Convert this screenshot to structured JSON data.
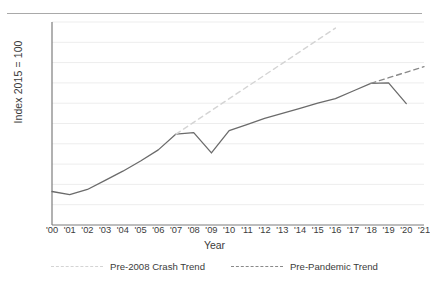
{
  "chart_data": {
    "type": "line",
    "title": "",
    "xlabel": "Year",
    "ylabel": "Index 2015 = 100",
    "xlim": [
      2000,
      2021
    ],
    "ylim": [
      40,
      140
    ],
    "ytick_step": 10,
    "yticks": [
      40,
      50,
      60,
      70,
      80,
      90,
      100,
      110,
      120,
      130,
      140
    ],
    "xticks": [
      "'00",
      "'01",
      "'02",
      "'03",
      "'04",
      "'05",
      "'06",
      "'07",
      "'08",
      "'09",
      "'10",
      "'11",
      "'12",
      "'13",
      "'14",
      "'15",
      "'16",
      "'17",
      "'18",
      "'19",
      "'20",
      "'21"
    ],
    "x": [
      2000,
      2001,
      2002,
      2003,
      2004,
      2005,
      2006,
      2007,
      2008,
      2009,
      2010,
      2011,
      2012,
      2013,
      2014,
      2015,
      2016,
      2017,
      2018,
      2019,
      2020
    ],
    "grid": "horizontal",
    "legend_position": "bottom",
    "series": [
      {
        "name": "Actual Index",
        "style": "solid",
        "color": "#6b6b6b",
        "x": [
          2000,
          2001,
          2002,
          2003,
          2004,
          2005,
          2006,
          2007,
          2008,
          2009,
          2010,
          2011,
          2012,
          2013,
          2014,
          2015,
          2016,
          2017,
          2018,
          2019,
          2020
        ],
        "values": [
          56.5,
          55.0,
          57.5,
          62.0,
          66.5,
          71.5,
          77.0,
          84.8,
          85.5,
          75.5,
          86.5,
          89.5,
          92.5,
          95.0,
          97.5,
          100.0,
          102.3,
          106.0,
          109.8,
          110.0,
          99.8
        ]
      },
      {
        "name": "Pre-2008 Crash Trend",
        "style": "dashed",
        "color": "#d4d4d4",
        "x": [
          2007,
          2016
        ],
        "values": [
          84.8,
          137.0
        ]
      },
      {
        "name": "Pre-Pandemic Trend",
        "style": "dashed",
        "color": "#8a8a8a",
        "x": [
          2018,
          2021
        ],
        "values": [
          109.8,
          118.0
        ]
      }
    ]
  },
  "legend": {
    "items": [
      {
        "label": "Pre-2008 Crash Trend",
        "swatch": "crash"
      },
      {
        "label": "Pre-Pandemic Trend",
        "swatch": "pandemic"
      }
    ]
  },
  "colors": {
    "actual_line": "#6b6b6b",
    "crash_trend": "#d4d4d4",
    "pandemic_trend": "#8a8a8a",
    "gridline": "#ededed",
    "axis": "#7d7d7d",
    "top_rule": "#a9a9a9",
    "text": "#3b3b3b"
  }
}
